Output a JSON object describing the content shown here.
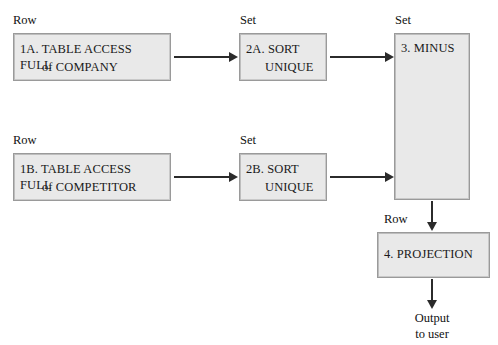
{
  "diagram": {
    "colors": {
      "box_fill": "#e9e9e9",
      "box_border": "#9a9a9a",
      "connector": "#2b2b2b",
      "text": "#1a1a1a",
      "background": "#ffffff"
    },
    "captions": [
      {
        "id": "cap-row-1a",
        "text": "Row"
      },
      {
        "id": "cap-set-2a",
        "text": "Set"
      },
      {
        "id": "cap-set-3",
        "text": "Set"
      },
      {
        "id": "cap-row-1b",
        "text": "Row"
      },
      {
        "id": "cap-set-2b",
        "text": "Set"
      },
      {
        "id": "cap-row-4",
        "text": "Row"
      }
    ],
    "nodes": [
      {
        "id": "node-1a",
        "line1": "1A. TABLE ACCESS FULL",
        "line2": "of COMPANY",
        "caption": "Row"
      },
      {
        "id": "node-2a",
        "line1": "2A. SORT",
        "line2": "UNIQUE",
        "caption": "Set"
      },
      {
        "id": "node-3",
        "line1": "3. MINUS",
        "line2": "",
        "caption": "Set"
      },
      {
        "id": "node-1b",
        "line1": "1B. TABLE ACCESS FULL",
        "line2": "of COMPETITOR",
        "caption": "Row"
      },
      {
        "id": "node-2b",
        "line1": "2B. SORT",
        "line2": "UNIQUE",
        "caption": "Set"
      },
      {
        "id": "node-4",
        "line1": "4. PROJECTION",
        "line2": "",
        "caption": "Row"
      }
    ],
    "output": {
      "line1": "Output",
      "line2": "to user"
    }
  }
}
